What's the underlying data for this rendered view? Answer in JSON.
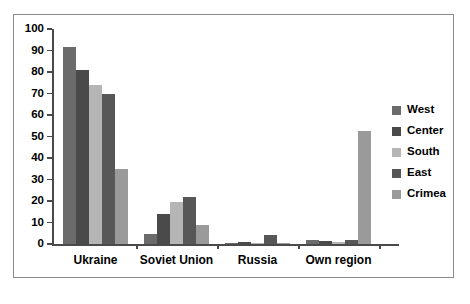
{
  "chart_data": {
    "type": "bar",
    "title": "",
    "subtitle": "",
    "xlabel": "",
    "ylabel": "",
    "categories": [
      "Ukraine",
      "Soviet Union",
      "Russia",
      "Own region"
    ],
    "series": [
      {
        "name": "West",
        "color": "#6b6b6b",
        "values": [
          91.5,
          4.5,
          0.4,
          2.0
        ]
      },
      {
        "name": "Center",
        "color": "#4a4a4a",
        "values": [
          81.0,
          14.0,
          1.0,
          1.5
        ]
      },
      {
        "name": "South",
        "color": "#b5b5b5",
        "values": [
          74.0,
          19.5,
          0.6,
          0.8
        ]
      },
      {
        "name": "East",
        "color": "#575757",
        "values": [
          70.0,
          22.0,
          4.0,
          2.0
        ]
      },
      {
        "name": "Crimea",
        "color": "#9a9a9a",
        "values": [
          35.0,
          9.0,
          0.5,
          52.5
        ]
      }
    ],
    "ylim": [
      0,
      100
    ],
    "ytick_step": 10,
    "yticks": [
      "0",
      "10",
      "20",
      "30",
      "40",
      "50",
      "60",
      "70",
      "80",
      "90",
      "100"
    ],
    "grid": false,
    "legend_position": "right",
    "legend_entries": [
      "West",
      "Center",
      "South",
      "East",
      "Crimea"
    ],
    "annotations": []
  },
  "frame": {
    "border_color": "#8a8a8a",
    "background": "#ffffff",
    "axis_color": "#4a4a4a"
  }
}
